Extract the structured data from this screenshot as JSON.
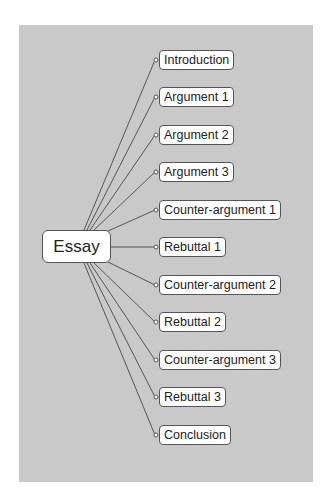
{
  "diagram": {
    "type": "mind-map",
    "root": {
      "label": "Essay"
    },
    "children": [
      {
        "label": "Introduction"
      },
      {
        "label": "Argument 1"
      },
      {
        "label": "Argument 2"
      },
      {
        "label": "Argument 3"
      },
      {
        "label": "Counter-argument 1"
      },
      {
        "label": "Rebuttal 1"
      },
      {
        "label": "Counter-argument 2"
      },
      {
        "label": "Rebuttal 2"
      },
      {
        "label": "Counter-argument 3"
      },
      {
        "label": "Rebuttal 3"
      },
      {
        "label": "Conclusion"
      }
    ],
    "colors": {
      "background": "#c9c9c9",
      "node_fill": "#ffffff",
      "line": "#555555"
    }
  }
}
